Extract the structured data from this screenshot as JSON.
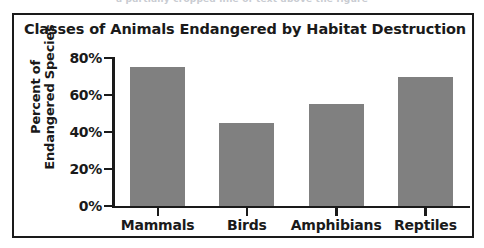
{
  "top_remnant_text": "a partially cropped line of text above the figure",
  "figure": {
    "title": "Classes of Animals Endangered by Habitat Destruction"
  },
  "chart_data": {
    "type": "bar",
    "title": "Classes of Animals Endangered by Habitat Destruction",
    "categories": [
      "Mammals",
      "Birds",
      "Amphibians",
      "Reptiles"
    ],
    "values": [
      75,
      45,
      55,
      70
    ],
    "xlabel": "",
    "ylabel_line1": "Percent of",
    "ylabel_line2": "Endangered Species",
    "ylim": [
      0,
      80
    ],
    "ytick_labels": [
      "0%",
      "20%",
      "40%",
      "60%",
      "80%"
    ],
    "ytick_values": [
      0,
      20,
      40,
      60,
      80
    ],
    "grid": false,
    "legend": false,
    "bar_color": "#808080",
    "axis_color": "#1a1a1a",
    "background_color": "#ffffff"
  }
}
